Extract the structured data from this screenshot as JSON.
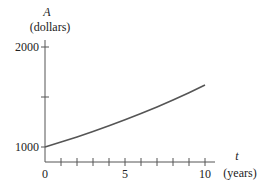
{
  "chart_data": {
    "type": "line",
    "title": "",
    "ylabel_var": "A",
    "ylabel_unit": "(dollars)",
    "xlabel_var": "t",
    "xlabel_unit": "(years)",
    "xlim": [
      0,
      10
    ],
    "ylim": [
      1000,
      2000
    ],
    "x_ticks": [
      0,
      1,
      2,
      3,
      4,
      5,
      6,
      7,
      8,
      9,
      10
    ],
    "x_tick_labels": {
      "0": "0",
      "5": "5",
      "10": "10"
    },
    "y_ticks": [
      1000,
      1500,
      2000
    ],
    "y_tick_labels": {
      "1000": "1000",
      "2000": "2000"
    },
    "grid": false,
    "legend": null,
    "series": [
      {
        "name": "A(t)",
        "x": [
          0,
          1,
          2,
          3,
          4,
          5,
          6,
          7,
          8,
          9,
          10
        ],
        "values": [
          1000,
          1049,
          1101,
          1155,
          1212,
          1272,
          1335,
          1401,
          1470,
          1543,
          1620
        ]
      }
    ]
  },
  "labels": {
    "y_var": "A",
    "y_unit": "(dollars)",
    "x_var": "t",
    "x_unit": "(years)",
    "y_2000": "2000",
    "y_1000": "1000",
    "x_0": "0",
    "x_5": "5",
    "x_10": "10"
  }
}
